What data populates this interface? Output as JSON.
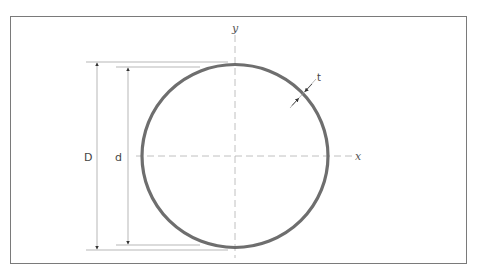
{
  "figure": {
    "type": "cross-section",
    "colors": {
      "background": "#ffffff",
      "frame": "#7a7a7a",
      "ring": "#6e6e6e",
      "dimension_lines": "#9a9a9a",
      "axis_lines": "#b0b0b0",
      "text": "#444444"
    }
  },
  "labels": {
    "outer_diameter": "D",
    "inner_diameter": "d",
    "thickness": "t",
    "x_axis": "x",
    "y_axis": "y"
  }
}
